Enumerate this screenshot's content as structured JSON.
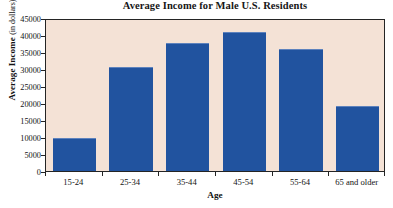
{
  "chart_data": {
    "type": "bar",
    "title": "Average Income for Male U.S. Residents",
    "xlabel": "Age",
    "ylabel": "Average Income",
    "ylabel_unit": "(in dollars)",
    "categories": [
      "15-24",
      "25-34",
      "35-44",
      "45-54",
      "55-64",
      "65 and older"
    ],
    "values": [
      9700,
      30600,
      37700,
      40900,
      36000,
      19100
    ],
    "ylim": [
      0,
      45000
    ],
    "ytick_values": [
      0,
      5000,
      10000,
      15000,
      20000,
      25000,
      30000,
      35000,
      40000,
      45000
    ],
    "ytick_labels": [
      "0",
      "5000",
      "10000",
      "15000",
      "20000",
      "25000",
      "30000",
      "35000",
      "40000",
      "45000"
    ],
    "grid": false,
    "legend": null,
    "series": [
      {
        "name": "Average Income",
        "values": [
          9700,
          30600,
          37700,
          40900,
          36000,
          19100
        ]
      }
    ],
    "colors": {
      "bar_fill": "#21539f",
      "bar_highlight": "#5d82bd",
      "plot_background": "#f4e2d6",
      "figure_background": "#ffffff",
      "axis": "#242424",
      "text": "#131313"
    }
  }
}
